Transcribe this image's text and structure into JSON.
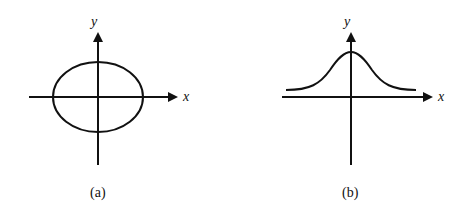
{
  "panels": [
    {
      "id": "a",
      "caption": "(a)",
      "x_label": "x",
      "y_label": "y",
      "curve": "ellipse centered at origin"
    },
    {
      "id": "b",
      "caption": "(b)",
      "x_label": "x",
      "y_label": "y",
      "curve": "bell-shaped curve above x-axis, peak on y-axis"
    }
  ],
  "colors": {
    "stroke": "#111111",
    "background": "#ffffff"
  }
}
